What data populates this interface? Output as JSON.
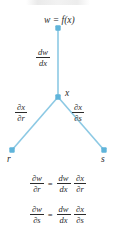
{
  "figure": {
    "type": "chain-rule-tree-diagram",
    "colors": {
      "node": "#5fb4da",
      "edge": "#8cc9e4",
      "text": "#2b2b2b",
      "background": "#ffffff"
    },
    "nodes": {
      "root": {
        "label": "w = f(x)"
      },
      "middle": {
        "label": "x"
      },
      "leaf_left": {
        "label": "r"
      },
      "leaf_right": {
        "label": "s"
      }
    },
    "edges": {
      "trunk": {
        "numerator": "dw",
        "denominator": "dx"
      },
      "left": {
        "numerator": "∂x",
        "denominator": "∂r"
      },
      "right": {
        "numerator": "∂x",
        "denominator": "∂s"
      }
    },
    "equations": [
      {
        "lhs": {
          "numerator": "∂w",
          "denominator": "∂r"
        },
        "sign": "=",
        "rhs": [
          {
            "numerator": "dw",
            "denominator": "dx"
          },
          {
            "numerator": "∂x",
            "denominator": "∂r"
          }
        ]
      },
      {
        "lhs": {
          "numerator": "∂w",
          "denominator": "∂s"
        },
        "sign": "=",
        "rhs": [
          {
            "numerator": "dw",
            "denominator": "dx"
          },
          {
            "numerator": "∂x",
            "denominator": "∂s"
          }
        ]
      }
    ]
  }
}
